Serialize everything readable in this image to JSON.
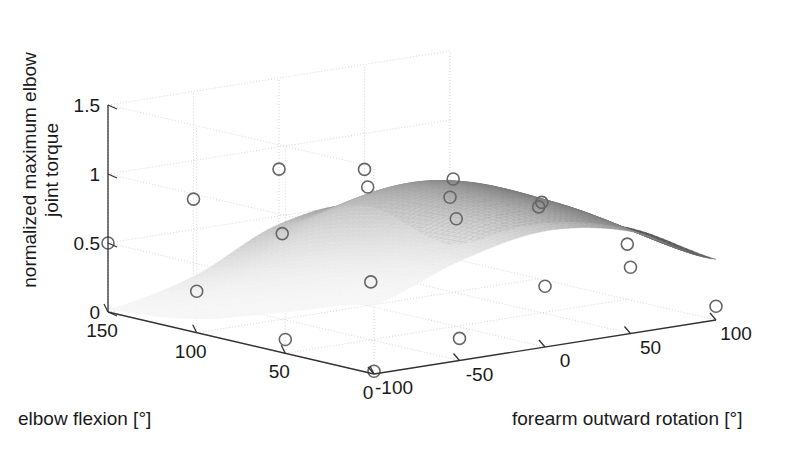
{
  "figure": {
    "width": 803,
    "height": 462,
    "background": "#ffffff",
    "type": "matlab-surface-3d"
  },
  "chart_data": {
    "type": "surface",
    "title": "",
    "xlabel": "elbow flexion [°]",
    "ylabel": "forearm outward rotation [°]",
    "zlabel": "normalized maximum elbow joint torque",
    "grid": true,
    "legend": null,
    "colormap": "gray",
    "x": [
      0,
      50,
      100,
      150
    ],
    "y": [
      -100,
      -50,
      0,
      50,
      100
    ],
    "xticks": [
      0,
      50,
      100,
      150
    ],
    "xticklabels": [
      "0",
      "50",
      "100",
      "150"
    ],
    "yticks": [
      -100,
      -50,
      0,
      50,
      100
    ],
    "yticklabels": [
      "-100",
      "-50",
      "0",
      "50",
      "100"
    ],
    "zticks": [
      0,
      0.5,
      1,
      1.5
    ],
    "zticklabels": [
      "0",
      "0.5",
      "1",
      "1.5"
    ],
    "xlim": [
      0,
      150
    ],
    "ylim": [
      -100,
      100
    ],
    "zlim": [
      0,
      1.5
    ],
    "marker": "open-circle",
    "marker_edge_color": "#666666",
    "marker_face_color": "none",
    "marker_count": 20,
    "z_grid": [
      [
        0.5,
        0.72,
        0.84,
        0.74,
        0.44
      ],
      [
        0.3,
        0.62,
        0.86,
        0.82,
        0.52
      ],
      [
        0.1,
        0.42,
        0.78,
        0.8,
        0.4
      ],
      [
        0.02,
        0.16,
        0.44,
        0.48,
        0.1
      ]
    ],
    "data_points": [
      {
        "x": 150,
        "y": -100,
        "z": 0.5
      },
      {
        "x": 150,
        "y": -50,
        "z": 0.72
      },
      {
        "x": 150,
        "y": 0,
        "z": 0.84
      },
      {
        "x": 150,
        "y": 50,
        "z": 0.74
      },
      {
        "x": 150,
        "y": 100,
        "z": 0.44
      },
      {
        "x": 100,
        "y": -100,
        "z": 0.3
      },
      {
        "x": 100,
        "y": -50,
        "z": 0.62
      },
      {
        "x": 100,
        "y": 0,
        "z": 0.86
      },
      {
        "x": 100,
        "y": 50,
        "z": 0.82
      },
      {
        "x": 100,
        "y": 100,
        "z": 0.52
      },
      {
        "x": 50,
        "y": -100,
        "z": 0.1
      },
      {
        "x": 50,
        "y": -50,
        "z": 0.42
      },
      {
        "x": 50,
        "y": 0,
        "z": 0.78
      },
      {
        "x": 50,
        "y": 50,
        "z": 0.8
      },
      {
        "x": 50,
        "y": 100,
        "z": 0.4
      },
      {
        "x": 0,
        "y": -100,
        "z": 0.02
      },
      {
        "x": 0,
        "y": -50,
        "z": 0.16
      },
      {
        "x": 0,
        "y": 0,
        "z": 0.44
      },
      {
        "x": 0,
        "y": 50,
        "z": 0.48
      },
      {
        "x": 0,
        "y": 100,
        "z": 0.1
      }
    ],
    "zmax_observed": 0.86,
    "surface_shading": "grayscale-gradient-dark-on-right-edge"
  },
  "axes": {
    "x_axis_label": "elbow flexion [°]",
    "y_axis_label": "forearm outward rotation [°]",
    "z_axis_label": "normalized maximum elbow joint torque",
    "x_tick_texts": [
      "150",
      "100",
      "50",
      "0"
    ],
    "y_tick_texts": [
      "-100",
      "-50",
      "0",
      "50",
      "100"
    ],
    "z_tick_texts": [
      "1.5",
      "1",
      "0.5",
      "0"
    ],
    "axis_line_color": "#333333",
    "grid_line_color": "#cccccc"
  }
}
